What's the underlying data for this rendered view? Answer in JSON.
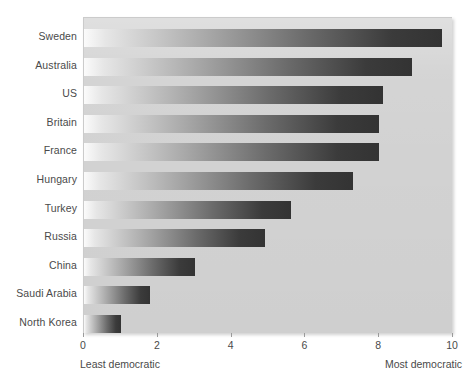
{
  "chart_data": {
    "type": "bar",
    "orientation": "horizontal",
    "title": "",
    "xlabel": "",
    "ylabel": "",
    "categories": [
      "Sweden",
      "Australia",
      "US",
      "Britain",
      "France",
      "Hungary",
      "Turkey",
      "Russia",
      "China",
      "Saudi Arabia",
      "North Korea"
    ],
    "values": [
      9.7,
      8.9,
      8.1,
      8.0,
      8.0,
      7.3,
      5.6,
      4.9,
      3.0,
      1.8,
      1.0
    ],
    "xlim": [
      0,
      10
    ],
    "xticks": [
      0,
      2,
      4,
      6,
      8,
      10
    ],
    "xtick_labels": [
      "0",
      "2",
      "4",
      "6",
      "8",
      "10"
    ],
    "grid": false,
    "legend": false,
    "annotations": {
      "axis_low_end": "Least democratic",
      "axis_high_end": "Most democratic"
    },
    "style": {
      "plot_background": "#d2d2d2",
      "bar_gradient_start": "#fbfbfb",
      "bar_gradient_end": "#333333",
      "text_color": "#4a4a4a"
    }
  }
}
